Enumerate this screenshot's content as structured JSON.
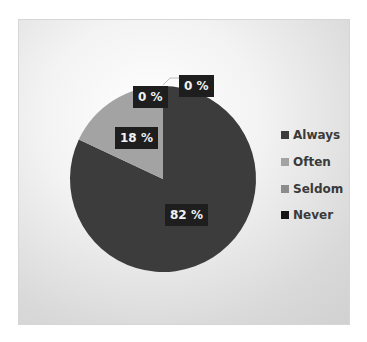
{
  "chart_data": {
    "type": "pie",
    "title": "",
    "categories": [
      "Always",
      "Often",
      "Seldom",
      "Never"
    ],
    "values": [
      82,
      18,
      0,
      0
    ],
    "labels": [
      "82 %",
      "18 %",
      "0 %",
      "0 %"
    ],
    "colors": [
      "#3c3c3c",
      "#a3a3a3",
      "#8c8c8c",
      "#141414"
    ],
    "legend_position": "right",
    "unit": "%"
  },
  "legend": {
    "items": [
      {
        "label": "Always",
        "color": "#3c3c3c"
      },
      {
        "label": "Often",
        "color": "#a3a3a3"
      },
      {
        "label": "Seldom",
        "color": "#8c8c8c"
      },
      {
        "label": "Never",
        "color": "#141414"
      }
    ]
  },
  "data_labels": {
    "always": "82 %",
    "often": "18 %",
    "seldom": "0 %",
    "never": "0 %"
  }
}
